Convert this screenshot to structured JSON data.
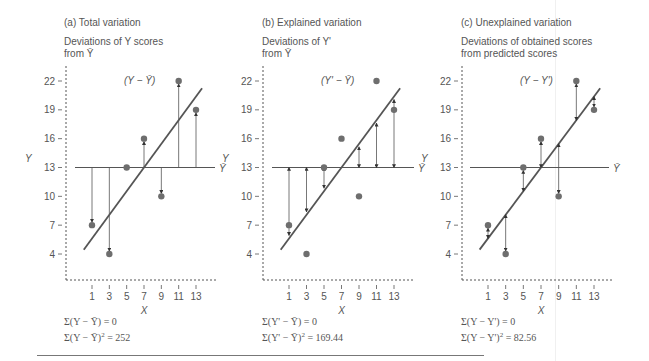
{
  "chart_data": [
    {
      "type": "scatter",
      "title": "(a) Total variation",
      "subtitle": "Deviations of Y scores\nfrom Ȳ",
      "deviation_label": "(Y − Ȳ)",
      "xlabel": "X",
      "ylabel": "Y",
      "x_ticks": [
        1,
        3,
        5,
        7,
        9,
        11,
        13
      ],
      "y_ticks": [
        4,
        7,
        10,
        13,
        16,
        19,
        22
      ],
      "x": [
        1,
        3,
        5,
        7,
        9,
        11,
        13
      ],
      "y": [
        7,
        4,
        13,
        16,
        10,
        22,
        19
      ],
      "mean_y": 13,
      "mean_label": "Ȳ",
      "regression": {
        "intercept_at_x7": 13,
        "slope": 1.23
      },
      "arrows": "from mean line to observed Y",
      "sum1": "Σ(Y − Ȳ) = 0",
      "sum2_prefix": "Σ(Y − Ȳ)",
      "sum2_value": "= 252",
      "ss": 252
    },
    {
      "type": "scatter",
      "title": "(b) Explained variation",
      "subtitle": "Deviations of Y'\nfrom Ȳ",
      "deviation_label": "(Y' − Ȳ)",
      "xlabel": "X",
      "ylabel": "Y",
      "x_ticks": [
        1,
        3,
        5,
        7,
        9,
        11,
        13
      ],
      "y_ticks": [
        4,
        7,
        10,
        13,
        16,
        19,
        22
      ],
      "x": [
        1,
        3,
        5,
        7,
        9,
        11,
        13
      ],
      "y": [
        7,
        4,
        13,
        16,
        10,
        22,
        19
      ],
      "mean_y": 13,
      "mean_label": "Ȳ",
      "regression": {
        "intercept_at_x7": 13,
        "slope": 1.23
      },
      "arrows": "from mean line to predicted Y'",
      "sum1": "Σ(Y' − Ȳ) = 0",
      "sum2_prefix": "Σ(Y' − Ȳ)",
      "sum2_value": "= 169.44",
      "ss": 169.44
    },
    {
      "type": "scatter",
      "title": "(c) Unexplained variation",
      "subtitle": "Deviations of obtained scores\nfrom predicted scores",
      "deviation_label": "(Y − Y')",
      "xlabel": "X",
      "ylabel": "Y",
      "x_ticks": [
        1,
        3,
        5,
        7,
        9,
        11,
        13
      ],
      "y_ticks": [
        4,
        7,
        10,
        13,
        16,
        19,
        22
      ],
      "x": [
        1,
        3,
        5,
        7,
        9,
        11,
        13
      ],
      "y": [
        7,
        4,
        13,
        16,
        10,
        22,
        19
      ],
      "mean_y": 13,
      "mean_label": "Ȳ",
      "regression": {
        "intercept_at_x7": 13,
        "slope": 1.23
      },
      "arrows": "from predicted Y' to observed Y",
      "sum1": "Σ(Y − Y') = 0",
      "sum2_prefix": "Σ(Y − Y')",
      "sum2_value": "= 82.56",
      "ss": 82.56
    }
  ],
  "colors": {
    "ink": "#555555",
    "dot": "#6e6e6e",
    "line": "#555555",
    "rule": "#777777"
  }
}
